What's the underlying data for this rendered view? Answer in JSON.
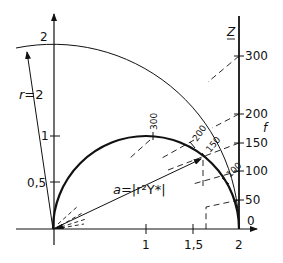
{
  "diagram": {
    "colors": {
      "ink": "#111111",
      "background": "#ffffff"
    },
    "geometry": {
      "origin_px": [
        53,
        229
      ],
      "unit_px": 93
    },
    "left_axis": {
      "tick_labels": [
        "0,5",
        "1",
        "2"
      ],
      "tick_values": [
        0.5,
        1,
        2
      ]
    },
    "bottom_axis": {
      "tick_labels": [
        "1",
        "1,5",
        "2"
      ],
      "tick_values": [
        1,
        1.5,
        2
      ]
    },
    "right_axis": {
      "name": "Z",
      "second_name": "f",
      "tick_labels": [
        "0",
        "50",
        "100",
        "150",
        "200",
        "300"
      ],
      "tick_values": [
        0,
        50,
        100,
        150,
        200,
        300
      ]
    },
    "large_arc": {
      "label": "r=2",
      "label_r": "r",
      "label_eq": "=2"
    },
    "semicircle": {
      "marks": [
        "300",
        "200",
        "150",
        "100"
      ]
    },
    "vector_label": {
      "text": "a=|r²Y*|",
      "a": "a",
      "rest": "=|r²Y*|"
    }
  }
}
